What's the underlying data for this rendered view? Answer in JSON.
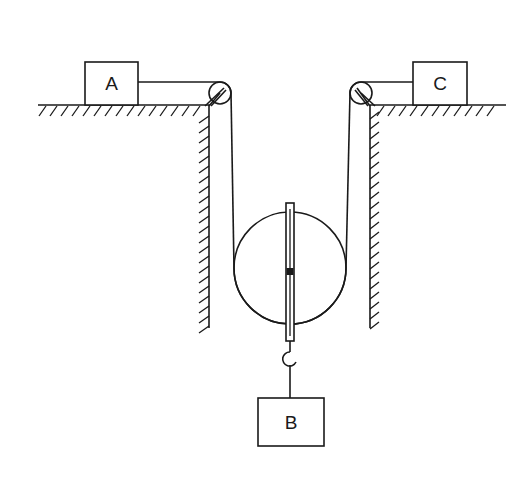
{
  "diagram": {
    "type": "physics-pulley-system",
    "blocks": [
      {
        "id": "A",
        "label": "A",
        "position": "left-surface"
      },
      {
        "id": "B",
        "label": "B",
        "position": "hanging-below-movable-pulley"
      },
      {
        "id": "C",
        "label": "C",
        "position": "right-surface"
      }
    ],
    "components": [
      "left horizontal surface with hatching",
      "right horizontal surface with hatching",
      "left vertical wall with hatching",
      "right vertical wall with hatching",
      "left fixed pulley at corner",
      "right fixed pulley at corner",
      "movable pulley with spring scale axle",
      "hook supporting block B",
      "rope from A over left pulley under movable pulley over right pulley to C"
    ],
    "colors": {
      "stroke": "#1a1a1a",
      "background": "#ffffff"
    }
  }
}
